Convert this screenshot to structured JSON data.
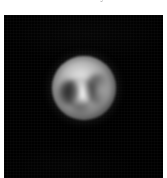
{
  "page": {
    "background_color": "#ffffff",
    "width_px": 167,
    "height_px": 178
  },
  "caption": {
    "text": "their surfaces to be surveyed",
    "note": "clipped at top edge of screenshot; only descender tips rendered",
    "color": "#4a4a4a"
  },
  "image_panel": {
    "background_color": "#000000",
    "left_px": 4,
    "top_px": 15,
    "width_px": 159,
    "height_px": 163
  },
  "chart_data": {
    "type": "heatmap",
    "title": "",
    "subtitle": "",
    "xlabel": "",
    "ylabel": "",
    "grid": false,
    "legend": "none",
    "colormap": "grayscale",
    "background_color": "#000000",
    "object": {
      "name": "planetary-disk",
      "center_x_px": 84,
      "center_y_px": 88,
      "radius_px": 29,
      "peak_brightness": 255,
      "background_brightness": 4
    },
    "features": [
      {
        "name": "bright-core",
        "kind": "bright-region",
        "center_x_px": 76,
        "center_y_px": 92,
        "radius_px": 11,
        "brightness": 255
      },
      {
        "name": "dark-patch-left-limb",
        "kind": "dark-region",
        "center_x_px": 65,
        "center_y_px": 87,
        "radius_px": 11,
        "brightness": 28
      },
      {
        "name": "dark-band-upper-right",
        "kind": "dark-region",
        "center_x_px": 94,
        "center_y_px": 83,
        "radius_px": 11,
        "brightness": 52
      },
      {
        "name": "bright-limb-top-left",
        "kind": "bright-region",
        "center_x_px": 79,
        "center_y_px": 66,
        "radius_px": 13,
        "brightness": 196
      },
      {
        "name": "bright-patch-right-limb",
        "kind": "bright-region",
        "center_x_px": 100,
        "center_y_px": 89,
        "radius_px": 9,
        "brightness": 168
      },
      {
        "name": "dark-notch-lower-left",
        "kind": "dark-region",
        "center_x_px": 76,
        "center_y_px": 110,
        "radius_px": 8,
        "brightness": 64
      }
    ],
    "colors": {
      "sky": "#000000",
      "disk_mid": "#8e8e8e",
      "disk_bright": "#ffffff",
      "disk_dark": "#1c1c1c",
      "limb": "#2e2e2e"
    }
  }
}
